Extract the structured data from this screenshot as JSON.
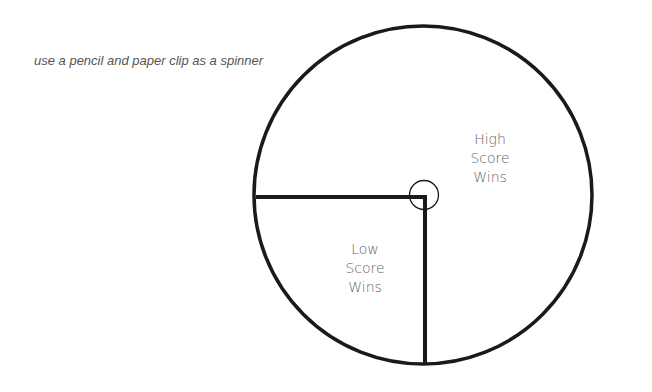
{
  "instruction": "use a pencil and paper clip as a spinner",
  "spinner": {
    "sections": [
      {
        "id": "high",
        "lines": [
          "High",
          "Score",
          "Wins"
        ],
        "portion": "three-quarters"
      },
      {
        "id": "low",
        "lines": [
          "Low",
          "Score",
          "Wins"
        ],
        "portion": "one-quarter (lower-left)"
      }
    ],
    "colors": {
      "stroke": "#1a1a1a",
      "label": "#666666",
      "instruction": "#555555"
    }
  }
}
